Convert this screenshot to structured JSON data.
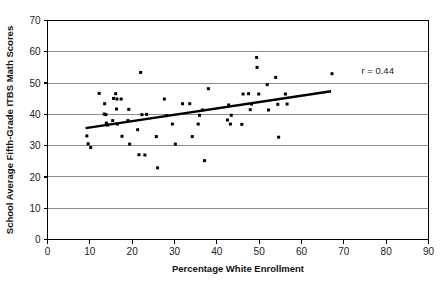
{
  "chart_data": {
    "type": "scatter",
    "title": "",
    "xlabel": "Percentage White Enrollment",
    "ylabel": "School Average Fifth-Grade ITBS Math Scores",
    "xlim": [
      0,
      90
    ],
    "ylim": [
      0,
      70
    ],
    "xticks": [
      0,
      10,
      20,
      30,
      40,
      50,
      60,
      70,
      80,
      90
    ],
    "yticks": [
      0,
      10,
      20,
      30,
      40,
      50,
      60,
      70
    ],
    "xtick_labels": [
      "0",
      "10",
      "20",
      "30",
      "40",
      "50",
      "60",
      "70",
      "80",
      "90"
    ],
    "ytick_labels": [
      "0",
      "10",
      "20",
      "30",
      "40",
      "50",
      "60",
      "70"
    ],
    "grid": "horizontal",
    "legend": "none",
    "annotations": [
      {
        "text": "r = 0.44",
        "x": 78,
        "y": 53,
        "name": "correlation-annotation"
      }
    ],
    "correlation": 0.44,
    "marker_color": "#000000",
    "gridline_color": "#8c8c8c",
    "axis_color": "#000000",
    "trend_line": {
      "color": "#000000",
      "x_start": 9.0,
      "y_start": 35.6,
      "x_end": 67.0,
      "y_end": 47.4
    },
    "points": [
      [
        9.3,
        33.1
      ],
      [
        9.6,
        30.6
      ],
      [
        10.2,
        29.4
      ],
      [
        12.2,
        46.7
      ],
      [
        13.4,
        40.1
      ],
      [
        13.5,
        43.4
      ],
      [
        13.8,
        39.9
      ],
      [
        13.9,
        37.2
      ],
      [
        14.2,
        36.6
      ],
      [
        15.4,
        38.0
      ],
      [
        15.6,
        45.1
      ],
      [
        16.1,
        46.6
      ],
      [
        16.3,
        41.7
      ],
      [
        16.4,
        44.9
      ],
      [
        16.5,
        36.9
      ],
      [
        17.4,
        44.9
      ],
      [
        17.6,
        33.0
      ],
      [
        19.0,
        38.0
      ],
      [
        19.2,
        41.6
      ],
      [
        19.4,
        30.5
      ],
      [
        21.3,
        35.1
      ],
      [
        21.6,
        27.1
      ],
      [
        22.0,
        53.4
      ],
      [
        22.3,
        39.9
      ],
      [
        23.0,
        27.0
      ],
      [
        23.4,
        40.0
      ],
      [
        25.7,
        32.9
      ],
      [
        26.0,
        22.9
      ],
      [
        27.6,
        44.9
      ],
      [
        28.1,
        39.6
      ],
      [
        29.5,
        36.9
      ],
      [
        30.2,
        30.5
      ],
      [
        31.9,
        43.4
      ],
      [
        33.6,
        43.4
      ],
      [
        34.2,
        32.9
      ],
      [
        35.6,
        36.9
      ],
      [
        35.9,
        39.7
      ],
      [
        36.6,
        41.4
      ],
      [
        37.1,
        25.2
      ],
      [
        38.0,
        48.2
      ],
      [
        42.5,
        38.2
      ],
      [
        42.8,
        43.0
      ],
      [
        43.2,
        36.9
      ],
      [
        43.4,
        39.7
      ],
      [
        45.9,
        36.8
      ],
      [
        46.2,
        46.5
      ],
      [
        47.5,
        46.6
      ],
      [
        47.9,
        41.5
      ],
      [
        48.2,
        43.3
      ],
      [
        49.4,
        58.2
      ],
      [
        49.5,
        55.0
      ],
      [
        49.9,
        46.5
      ],
      [
        51.9,
        49.5
      ],
      [
        52.2,
        41.4
      ],
      [
        53.9,
        51.8
      ],
      [
        54.4,
        43.2
      ],
      [
        54.6,
        32.7
      ],
      [
        56.2,
        46.5
      ],
      [
        56.6,
        43.3
      ],
      [
        67.2,
        53.0
      ]
    ]
  }
}
